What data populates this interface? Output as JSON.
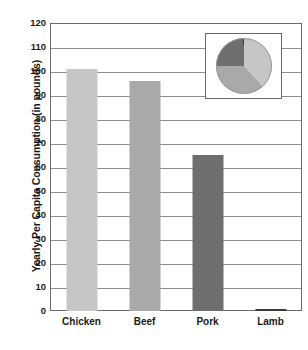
{
  "chart_data": {
    "type": "bar",
    "title": "",
    "xlabel": "",
    "ylabel": "Yearly Per Capita Consumption (in pounds)",
    "categories": [
      "Chicken",
      "Beef",
      "Pork",
      "Lamb"
    ],
    "values": [
      101,
      96,
      65,
      1
    ],
    "ylim": [
      0,
      120
    ],
    "yticks": [
      0,
      10,
      20,
      30,
      40,
      50,
      60,
      70,
      80,
      90,
      100,
      110,
      120
    ],
    "ytick_labels": [
      "0",
      "10",
      "20",
      "30",
      "40",
      "50",
      "60",
      "70",
      "80",
      "90",
      "100",
      "110",
      "120"
    ],
    "grid": true,
    "grid_axis": "y",
    "legend": "none",
    "bar_colors": [
      "#c6c6c6",
      "#a9a9a9",
      "#6e6e6e",
      "#3a3a3a"
    ],
    "inset": {
      "type": "pie",
      "categories": [
        "Chicken",
        "Beef",
        "Pork",
        "Lamb"
      ],
      "values": [
        101,
        96,
        65,
        1
      ],
      "percentages": [
        38.4,
        36.5,
        24.7,
        0.4
      ],
      "colors": [
        "#c6c6c6",
        "#a9a9a9",
        "#6e6e6e",
        "#3a3a3a"
      ],
      "start_angle_deg": 0,
      "direction": "clockwise"
    }
  },
  "axis": {
    "y_title": "Yearly Per Capita Consumption (in pounds)"
  },
  "colors": {
    "frame": "#6b6b6b",
    "gridline": "#8e8e8e",
    "text": "#1a1a1a",
    "background": "#ffffff"
  }
}
